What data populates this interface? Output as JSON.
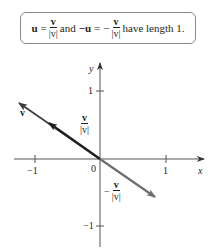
{
  "formula": {
    "u_symbol": "u",
    "equals": "=",
    "frac1_num": "v",
    "frac1_den": "|v|",
    "and_text": "and",
    "neg_u": "−u",
    "equals2": "=",
    "minus": "−",
    "frac2_num": "v",
    "frac2_den": "|v|",
    "tail_text": "have length 1."
  },
  "axes": {
    "x_label": "x",
    "y_label": "y",
    "x_ticks": [
      "−1",
      "1"
    ],
    "y_ticks": [
      "1",
      "−1"
    ],
    "origin_label": "0"
  },
  "vectors": {
    "v_label": "v",
    "unit_label_num": "v",
    "unit_label_den": "|v|",
    "neg_unit_minus": "−",
    "neg_unit_num": "v",
    "neg_unit_den": "|v|",
    "colors": {
      "v": "#3a3a3a",
      "unit": "#231f20",
      "neg_unit": "#6e6e6e",
      "axes": "#555555"
    }
  }
}
